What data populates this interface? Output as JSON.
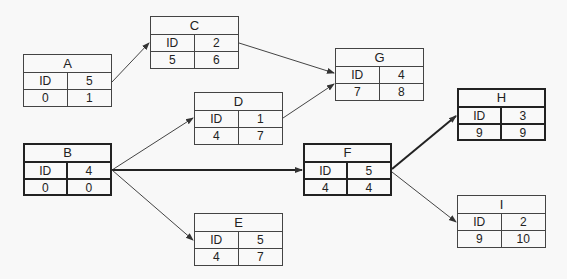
{
  "diagram": {
    "type": "activity-on-node network",
    "nodes": [
      {
        "id": "A",
        "label": "ID",
        "duration": "5",
        "earliest_start": "0",
        "earliest_finish": "1",
        "x": 23,
        "y": 54,
        "critical": false
      },
      {
        "id": "B",
        "label": "ID",
        "duration": "4",
        "earliest_start": "0",
        "earliest_finish": "0",
        "x": 23,
        "y": 143,
        "critical": true
      },
      {
        "id": "C",
        "label": "ID",
        "duration": "2",
        "earliest_start": "5",
        "earliest_finish": "6",
        "x": 150,
        "y": 16,
        "critical": false
      },
      {
        "id": "D",
        "label": "ID",
        "duration": "1",
        "earliest_start": "4",
        "earliest_finish": "7",
        "x": 194,
        "y": 92,
        "critical": false
      },
      {
        "id": "E",
        "label": "ID",
        "duration": "5",
        "earliest_start": "4",
        "earliest_finish": "7",
        "x": 194,
        "y": 213,
        "critical": false
      },
      {
        "id": "F",
        "label": "ID",
        "duration": "5",
        "earliest_start": "4",
        "earliest_finish": "4",
        "x": 303,
        "y": 143,
        "critical": true
      },
      {
        "id": "G",
        "label": "ID",
        "duration": "4",
        "earliest_start": "7",
        "earliest_finish": "8",
        "x": 335,
        "y": 48,
        "critical": false
      },
      {
        "id": "H",
        "label": "ID",
        "duration": "3",
        "earliest_start": "9",
        "earliest_finish": "9",
        "x": 457,
        "y": 88,
        "critical": true
      },
      {
        "id": "I",
        "label": "ID",
        "duration": "2",
        "earliest_start": "9",
        "earliest_finish": "10",
        "x": 457,
        "y": 195,
        "critical": false
      }
    ],
    "edges": [
      {
        "from": "A",
        "to": "C",
        "critical": false
      },
      {
        "from": "C",
        "to": "G",
        "critical": false
      },
      {
        "from": "D",
        "to": "G",
        "critical": false
      },
      {
        "from": "B",
        "to": "D",
        "critical": false
      },
      {
        "from": "B",
        "to": "F",
        "critical": true
      },
      {
        "from": "B",
        "to": "E",
        "critical": false
      },
      {
        "from": "F",
        "to": "H",
        "critical": true
      },
      {
        "from": "F",
        "to": "I",
        "critical": false
      }
    ]
  }
}
